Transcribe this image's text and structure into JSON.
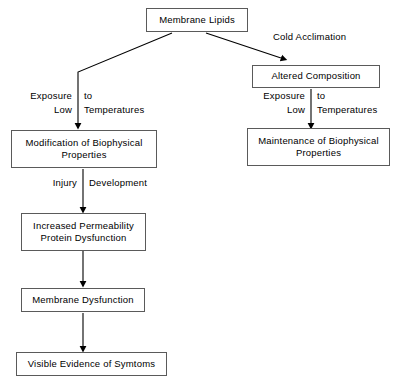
{
  "diagram": {
    "colors": {
      "background": "#ffffff",
      "box_border": "#5a5a5a",
      "connector": "#000000",
      "text": "#000000"
    },
    "nodes": {
      "membrane_lipids": "Membrane Lipids",
      "altered_composition": "Altered Composition",
      "maintenance": "Maintenance of Biophysical Properties",
      "modification": "Modification of Biophysical Properties",
      "increased_permeability": "Increased Permeability Protein Dysfunction",
      "membrane_dysfunction": "Membrane Dysfunction",
      "visible_evidence": "Visible Evidence of Symtoms"
    },
    "node_lines": {
      "maintenance_line1": "Maintenance of Biophysical",
      "maintenance_line2": "Properties",
      "modification_line1": "Modification of Biophysical",
      "modification_line2": "Properties",
      "permeability_line1": "Increased Permeability",
      "permeability_line2": "Protein Dysfunction"
    },
    "edge_labels": {
      "cold_acclimation": "Cold Acclimation",
      "left_exposure": "Exposure",
      "left_to": "to",
      "left_low": "Low",
      "left_temperatures": "Temperatures",
      "right_exposure": "Exposure",
      "right_to": "to",
      "right_low": "Low",
      "right_temperatures": "Temperatures",
      "injury": "Injury",
      "development": "Development"
    }
  }
}
